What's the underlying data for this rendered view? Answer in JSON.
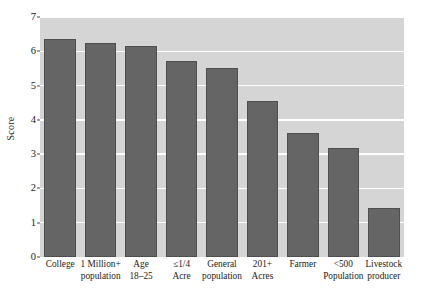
{
  "chart_data": {
    "type": "bar",
    "title": "",
    "subtitle": "",
    "xlabel": "",
    "ylabel": "Score",
    "ylim": [
      0,
      7
    ],
    "xlim": null,
    "grid": true,
    "gridlines_axis": "y",
    "legend": null,
    "legend_position": "none",
    "y_ticks": [
      0,
      1,
      2,
      3,
      4,
      5,
      6,
      7
    ],
    "y_tick_labels": [
      "0",
      "1",
      "2",
      "3",
      "4",
      "5",
      "6",
      "7"
    ],
    "categories": [
      "College",
      "1 Million+ population",
      "Age 18–25",
      "≤1/4 Acre",
      "General population",
      "201+ Acres",
      "Farmer",
      "<500 Population",
      "Livestock producer"
    ],
    "category_lines": [
      [
        "College"
      ],
      [
        "1 Million+",
        "population"
      ],
      [
        "Age",
        "18–25"
      ],
      [
        "≤1/4",
        "Acre"
      ],
      [
        "General",
        "population"
      ],
      [
        "201+",
        "Acres"
      ],
      [
        "Farmer"
      ],
      [
        "<500",
        "Population"
      ],
      [
        "Livestock",
        "producer"
      ]
    ],
    "values": [
      6.35,
      6.25,
      6.15,
      5.72,
      5.52,
      4.55,
      3.62,
      3.18,
      1.42
    ],
    "bar_color": "#656565",
    "bar_edge_color": "#4e4e4e",
    "plot_background_color": "#d5d5d5",
    "gridline_color": "#ffffff",
    "figure_background_color": "#ffffff",
    "text_color": "#1a1a1a"
  }
}
